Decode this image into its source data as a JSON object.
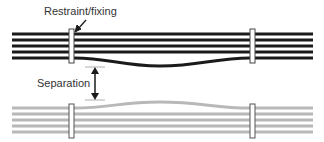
{
  "diagram": {
    "labels": {
      "restraint": "Restraint/fixing",
      "separation": "Separation"
    },
    "colors": {
      "top_lines": "#1a1a1a",
      "bottom_lines": "#b8b8b8",
      "clamp_fill": "#ffffff",
      "clamp_stroke": "#444444",
      "text": "#333333"
    },
    "top_bundle": {
      "line_count": 5,
      "lines_y": [
        34,
        40,
        46,
        52,
        58
      ],
      "x_start": 12,
      "x_end": 313,
      "sag_line_index": 4,
      "sag_depth": 8
    },
    "bottom_bundle": {
      "line_count": 5,
      "lines_y": [
        108,
        114,
        120,
        126,
        132
      ],
      "x_start": 12,
      "x_end": 313,
      "bulge_line_index": 0,
      "bulge_height": 6
    },
    "clamps": [
      {
        "x": 69,
        "width": 5
      },
      {
        "x": 250,
        "width": 5
      }
    ]
  }
}
